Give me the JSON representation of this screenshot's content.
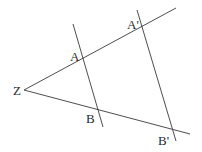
{
  "diagram": {
    "labels": {
      "Z": "Z",
      "A": "A",
      "B": "B",
      "A_prime": "A'",
      "B_prime": "B'"
    },
    "colors": {
      "line": "#3a3a3a",
      "text": "#2a2a2a",
      "background": "#ffffff"
    },
    "points": {
      "Z": [
        24,
        90
      ],
      "A": [
        83,
        58
      ],
      "B": [
        98,
        110
      ],
      "A_prime": [
        142,
        27
      ],
      "B_prime": [
        170,
        128
      ]
    }
  }
}
